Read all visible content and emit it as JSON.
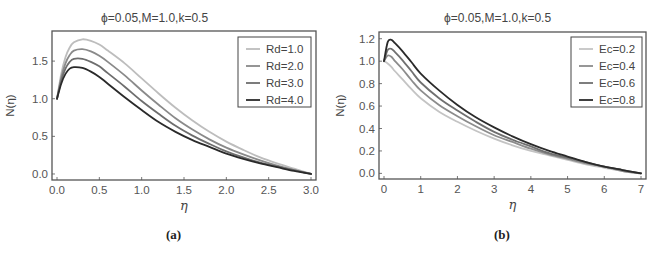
{
  "colors": {
    "frame": "#555555",
    "tick_text": "#555555",
    "series_a": [
      "#bdbdbd",
      "#8a8a8a",
      "#6e6e6e",
      "#2a2a2a"
    ],
    "series_b": [
      "#c4c4c4",
      "#8c8c8c",
      "#707070",
      "#2a2a2a"
    ]
  },
  "panels": [
    {
      "caption": "(a)",
      "title": "ϕ=0.05,M=1.0,k=0.5"
    },
    {
      "caption": "(b)",
      "title": "ϕ=0.05,M=1.0,k=0.5"
    }
  ],
  "chart_data": [
    {
      "type": "line",
      "title": "ϕ=0.05,M=1.0,k=0.5",
      "xlabel": "η",
      "ylabel": "N(η)",
      "xlim": [
        0,
        3
      ],
      "ylim": [
        -0.08,
        1.9
      ],
      "xticks": [
        0.0,
        0.5,
        1.0,
        1.5,
        2.0,
        2.5,
        3.0
      ],
      "xtick_labels": [
        "0.0",
        "0.5",
        "1.0",
        "1.5",
        "2.0",
        "2.5",
        "3.0"
      ],
      "yticks": [
        0.0,
        0.5,
        1.0,
        1.5
      ],
      "ytick_labels": [
        "0.0",
        "0.5",
        "1.0",
        "1.5"
      ],
      "grid": false,
      "legend_position": "upper right",
      "caption": "(a)",
      "x": [
        0.0,
        0.05,
        0.1,
        0.15,
        0.2,
        0.3,
        0.4,
        0.5,
        0.6,
        0.8,
        1.0,
        1.2,
        1.4,
        1.6,
        1.8,
        2.0,
        2.2,
        2.4,
        2.6,
        2.8,
        3.0
      ],
      "series": [
        {
          "name": "Rd=1.0",
          "values": [
            1.0,
            1.33,
            1.55,
            1.68,
            1.75,
            1.79,
            1.77,
            1.72,
            1.64,
            1.47,
            1.27,
            1.07,
            0.88,
            0.71,
            0.56,
            0.43,
            0.32,
            0.22,
            0.14,
            0.07,
            0.0
          ]
        },
        {
          "name": "Rd=2.0",
          "values": [
            1.0,
            1.28,
            1.47,
            1.58,
            1.64,
            1.66,
            1.63,
            1.57,
            1.49,
            1.31,
            1.11,
            0.92,
            0.74,
            0.59,
            0.46,
            0.35,
            0.26,
            0.18,
            0.11,
            0.05,
            0.0
          ]
        },
        {
          "name": "Rd=3.0",
          "values": [
            1.0,
            1.24,
            1.4,
            1.49,
            1.53,
            1.53,
            1.49,
            1.43,
            1.34,
            1.16,
            0.97,
            0.8,
            0.64,
            0.51,
            0.4,
            0.3,
            0.22,
            0.15,
            0.1,
            0.05,
            0.0
          ]
        },
        {
          "name": "Rd=4.0",
          "values": [
            1.0,
            1.2,
            1.33,
            1.4,
            1.42,
            1.41,
            1.36,
            1.29,
            1.2,
            1.02,
            0.85,
            0.69,
            0.56,
            0.45,
            0.36,
            0.27,
            0.2,
            0.14,
            0.09,
            0.04,
            0.0
          ]
        }
      ]
    },
    {
      "type": "line",
      "title": "ϕ=0.05,M=1.0,k=0.5",
      "xlabel": "η",
      "ylabel": "N(η)",
      "xlim": [
        0,
        7
      ],
      "ylim": [
        -0.05,
        1.26
      ],
      "xticks": [
        0,
        1,
        2,
        3,
        4,
        5,
        6,
        7
      ],
      "xtick_labels": [
        "0",
        "1",
        "2",
        "3",
        "4",
        "5",
        "6",
        "7"
      ],
      "yticks": [
        0.0,
        0.2,
        0.4,
        0.6,
        0.8,
        1.0,
        1.2
      ],
      "ytick_labels": [
        "0.0",
        "0.2",
        "0.4",
        "0.6",
        "0.8",
        "1.0",
        "1.2"
      ],
      "grid": false,
      "legend_position": "upper right",
      "caption": "(b)",
      "x": [
        0.0,
        0.1,
        0.2,
        0.3,
        0.5,
        0.75,
        1.0,
        1.5,
        2.0,
        2.5,
        3.0,
        3.5,
        4.0,
        4.5,
        5.0,
        5.5,
        6.0,
        6.5,
        7.0
      ],
      "series": [
        {
          "name": "Ec=0.2",
          "values": [
            1.0,
            0.98,
            0.95,
            0.91,
            0.84,
            0.75,
            0.67,
            0.55,
            0.46,
            0.38,
            0.31,
            0.25,
            0.2,
            0.16,
            0.12,
            0.08,
            0.05,
            0.02,
            0.0
          ]
        },
        {
          "name": "Ec=0.4",
          "values": [
            1.0,
            1.05,
            1.04,
            1.0,
            0.93,
            0.83,
            0.74,
            0.61,
            0.51,
            0.42,
            0.34,
            0.28,
            0.22,
            0.17,
            0.13,
            0.09,
            0.06,
            0.02,
            0.0
          ]
        },
        {
          "name": "Ec=0.6",
          "values": [
            1.0,
            1.1,
            1.11,
            1.08,
            1.01,
            0.91,
            0.81,
            0.67,
            0.56,
            0.46,
            0.37,
            0.3,
            0.24,
            0.18,
            0.14,
            0.1,
            0.06,
            0.03,
            0.0
          ]
        },
        {
          "name": "Ec=0.8",
          "values": [
            1.0,
            1.17,
            1.19,
            1.16,
            1.09,
            0.99,
            0.89,
            0.74,
            0.61,
            0.5,
            0.41,
            0.33,
            0.26,
            0.2,
            0.15,
            0.1,
            0.06,
            0.03,
            0.0
          ]
        }
      ]
    }
  ]
}
